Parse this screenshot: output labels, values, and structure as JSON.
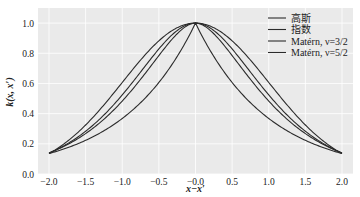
{
  "chart_data": {
    "type": "line",
    "title": "",
    "xlabel": "x−x′",
    "ylabel": "k(x, x′)",
    "xlim": [
      -2.15,
      2.15
    ],
    "ylim": [
      0.0,
      1.1
    ],
    "xticks": [
      -2.0,
      -1.5,
      -1.0,
      -0.5,
      0.0,
      0.5,
      1.0,
      1.5,
      2.0
    ],
    "xtick_labels": [
      "−2.0",
      "−1.5",
      "−1.0",
      "−0.5",
      "−0.0",
      "0.5",
      "1.0",
      "1.5",
      "2.0"
    ],
    "yticks": [
      0.0,
      0.2,
      0.4,
      0.6,
      0.8,
      1.0
    ],
    "ytick_labels": [
      "0.0",
      "0.2",
      "0.4",
      "0.6",
      "0.8",
      "1.0"
    ],
    "grid": true,
    "background": "#eaeaea",
    "line_color": "#2b2b2b",
    "legend_position": "upper right",
    "x": [
      -2.0,
      -1.5,
      -1.0,
      -0.5,
      0.0,
      0.5,
      1.0,
      1.5,
      2.0
    ],
    "series": [
      {
        "name": "高斯",
        "kind": "gaussian",
        "values": [
          0.135,
          0.325,
          0.607,
          0.882,
          1.0,
          0.882,
          0.607,
          0.325,
          0.135
        ]
      },
      {
        "name": "指数",
        "kind": "exponential",
        "values": [
          0.135,
          0.223,
          0.368,
          0.607,
          1.0,
          0.607,
          0.368,
          0.223,
          0.135
        ]
      },
      {
        "name": "Matérn, ν=3/2",
        "kind": "matern32",
        "values": [
          0.14,
          0.27,
          0.48,
          0.78,
          1.0,
          0.78,
          0.48,
          0.27,
          0.14
        ]
      },
      {
        "name": "Matérn, ν=5/2",
        "kind": "matern52",
        "values": [
          0.138,
          0.29,
          0.52,
          0.83,
          1.0,
          0.83,
          0.52,
          0.29,
          0.138
        ]
      }
    ]
  },
  "legend": {
    "items": [
      "高斯",
      "指数",
      "Matérn, ν=3/2",
      "Matérn, ν=5/2"
    ]
  },
  "axes": {
    "xlabel": "x−x′",
    "ylabel": "k(x, x′)"
  }
}
